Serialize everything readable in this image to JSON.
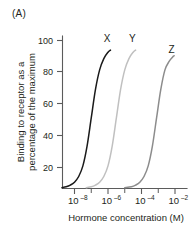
{
  "panel": {
    "label": "(A)"
  },
  "chart_data": {
    "type": "line",
    "title": "",
    "subtitle": "",
    "xlabel": "Hormone concentration (M)",
    "ylabel": "Binding to receptor as a percentage of the maximum",
    "ylabel_line1": "Binding to receptor as a",
    "ylabel_line2": "percentage of the maximum",
    "x_scale": "log",
    "x_tick_labels": [
      "10–8",
      "10–6",
      "10–4",
      "10–2"
    ],
    "x_tick_mantissas": [
      "10",
      "10",
      "10",
      "10"
    ],
    "x_tick_exponents": [
      "–8",
      "–6",
      "–4",
      "–2"
    ],
    "x_tick_log_values": [
      -8,
      -6,
      -4,
      -2
    ],
    "xlim_log": [
      -8.75,
      -1.6
    ],
    "y_tick_labels": [
      "20",
      "40",
      "60",
      "80",
      "100"
    ],
    "y_tick_values": [
      20,
      40,
      60,
      80,
      100
    ],
    "ylim": [
      0,
      108
    ],
    "grid": false,
    "legend_position": "inline-curve-labels",
    "minor_ticks_x": true,
    "series": [
      {
        "name": "X",
        "label": "X",
        "color": "#1a1a1a",
        "ec50_log": -7.0,
        "hill": 1.6,
        "x_log": [
          -8.75,
          -8.5,
          -8.25,
          -8.0,
          -7.75,
          -7.5,
          -7.25,
          -7.0,
          -6.75,
          -6.5,
          -6.25,
          -6.0,
          -5.85
        ],
        "values": [
          0.6,
          1.2,
          2.4,
          4.5,
          8.5,
          16,
          30,
          50,
          70,
          84,
          92,
          96.5,
          98
        ]
      },
      {
        "name": "Y",
        "label": "Y",
        "color": "#c0c0c0",
        "ec50_log": -5.5,
        "hill": 1.6,
        "x_log": [
          -7.3,
          -7.0,
          -6.75,
          -6.5,
          -6.25,
          -6.0,
          -5.75,
          -5.5,
          -5.25,
          -5.0,
          -4.75,
          -4.5,
          -4.35
        ],
        "values": [
          0.6,
          1.2,
          2.4,
          4.5,
          8.5,
          16,
          30,
          50,
          70,
          84,
          92,
          96.5,
          98
        ]
      },
      {
        "name": "Z",
        "label": "Z",
        "color": "#8c8c8c",
        "ec50_log": -3.1,
        "hill": 1.6,
        "x_log": [
          -5.0,
          -4.6,
          -4.35,
          -4.1,
          -3.85,
          -3.6,
          -3.35,
          -3.1,
          -2.85,
          -2.6,
          -2.35,
          -2.15,
          -2.05
        ],
        "values": [
          0.6,
          1.2,
          2.4,
          4.5,
          8.5,
          16,
          30,
          50,
          70,
          84,
          90,
          93,
          94
        ]
      }
    ],
    "annotations": [
      {
        "text": "X",
        "series": "X",
        "x_log": -6.05,
        "y": 104
      },
      {
        "text": "Y",
        "series": "Y",
        "x_log": -4.55,
        "y": 104
      },
      {
        "text": "Z",
        "series": "Z",
        "x_log": -2.2,
        "y": 96
      }
    ]
  }
}
